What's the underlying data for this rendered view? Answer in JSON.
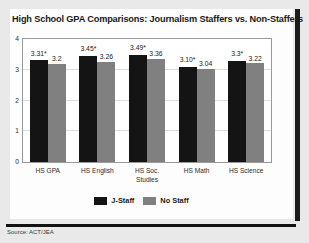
{
  "figure": {
    "title": "High School GPA Comparisons: Journalism Staffers vs. Non-Staffers",
    "source": "Source: ACT/JEA"
  },
  "legend": {
    "items": [
      {
        "label": "J-Staff",
        "color": "#141414"
      },
      {
        "label": "No Staff",
        "color": "#808080"
      }
    ]
  },
  "chart_data": {
    "type": "bar",
    "title": "High School GPA Comparisons: Journalism Staffers vs. Non-Staffers",
    "xlabel": "",
    "ylabel": "",
    "ylim": [
      0,
      4
    ],
    "yticks": [
      "0",
      "1",
      "2",
      "3",
      "4"
    ],
    "grid": true,
    "legend_position": "bottom-center",
    "categories": [
      "HS GPA",
      "HS English",
      "HS Soc. Studies",
      "HS Math",
      "HS Science"
    ],
    "category_lines": [
      [
        "HS GPA"
      ],
      [
        "HS English"
      ],
      [
        "HS Soc.",
        "Studies"
      ],
      [
        "HS Math"
      ],
      [
        "HS Science"
      ]
    ],
    "series": [
      {
        "name": "J-Staff",
        "color": "#141414",
        "values": [
          3.31,
          3.45,
          3.49,
          3.1,
          3.3
        ],
        "labels": [
          "3.31*",
          "3.45*",
          "3.49*",
          "3.10*",
          "3.3*"
        ]
      },
      {
        "name": "No Staff",
        "color": "#808080",
        "values": [
          3.2,
          3.26,
          3.36,
          3.04,
          3.22
        ],
        "labels": [
          "3.2",
          "3.26",
          "3.36",
          "3.04",
          "3.22"
        ]
      }
    ],
    "annotations": [
      "* denotes statistically significant difference"
    ]
  }
}
